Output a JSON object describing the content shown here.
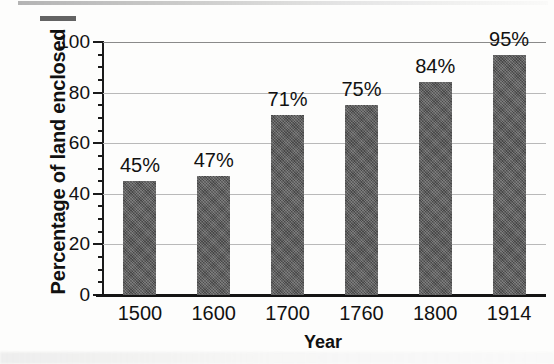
{
  "chart_data": {
    "type": "bar",
    "title": "",
    "xlabel": "Year",
    "ylabel": "Percentage of land enclosed",
    "categories": [
      "1500",
      "1600",
      "1700",
      "1760",
      "1800",
      "1914"
    ],
    "values": [
      45,
      47,
      71,
      75,
      84,
      95
    ],
    "data_labels": [
      "45%",
      "47%",
      "71%",
      "75%",
      "84%",
      "95%"
    ],
    "ylim": [
      0,
      100
    ],
    "ytick_labels": [
      "0",
      "20",
      "40",
      "60",
      "80",
      "100"
    ],
    "ytick_values": [
      0,
      20,
      40,
      60,
      80,
      100
    ],
    "yminor_tick_interval": 5,
    "grid": "horizontal",
    "legend": "none",
    "series": [
      {
        "name": "Percentage of land enclosed",
        "values": [
          45,
          47,
          71,
          75,
          84,
          95
        ]
      }
    ]
  },
  "style": {
    "bar_color": "#575757",
    "gridline_color": "#b9b9b9",
    "axis_color": "#141414",
    "text_color": "#111111",
    "background_color": "#fdfdfc"
  }
}
